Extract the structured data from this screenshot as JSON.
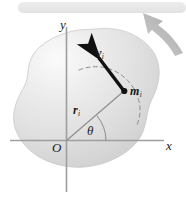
{
  "figure": {
    "background_color": "#ffffff",
    "banner": {
      "color": "#e8e8e8"
    },
    "body_blob": {
      "fill_light": "#f2f2f2",
      "fill_mid": "#dcdcdc",
      "fill_dark": "#c9c9c9",
      "edge_color": "#bdbdbd"
    },
    "axes": {
      "color": "#9a9a9a",
      "y_label": "y",
      "x_label": "x",
      "origin_label": "O"
    },
    "vectors": {
      "velocity": {
        "label": "v",
        "subscript": "i",
        "color": "#111111",
        "description": "velocity-vector-arrow"
      },
      "radius": {
        "label": "r",
        "subscript": "i",
        "color": "#8a8a8a",
        "description": "position-vector-line"
      }
    },
    "mass_element": {
      "label": "m",
      "subscript": "i",
      "dot_color": "#111111"
    },
    "angle": {
      "label": "θ",
      "arc_color": "#8a8a8a"
    },
    "rotation_arrow": {
      "color": "#b5b5b5",
      "description": "counterclockwise-rotation-indicator"
    },
    "path_arc": {
      "color": "#8f8f8f",
      "style": "dashed",
      "description": "circular-path-of-mass-element"
    }
  }
}
